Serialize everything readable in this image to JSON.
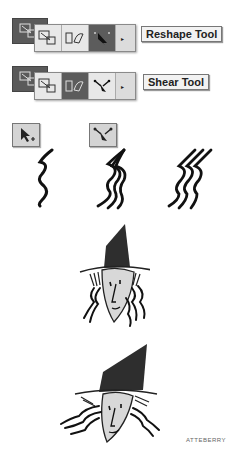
{
  "toolbars": [
    {
      "selected_tool": "reshape",
      "tooltip": "Reshape Tool",
      "buttons": [
        "scale-tool",
        "free-transform-tool",
        "warp-tool",
        "reshape-tool"
      ]
    },
    {
      "selected_tool": "free-transform",
      "tooltip": "Shear Tool",
      "buttons": [
        "scale-tool",
        "free-transform-tool",
        "warp-tool",
        "shear-tool"
      ]
    }
  ],
  "figures": {
    "tool_icons": [
      "direct-select-add-icon",
      "shear-tool-icon"
    ],
    "strokes": [
      "single-wavy-stroke",
      "reshaped-wavy-strokes",
      "sheared-wavy-strokes"
    ],
    "illustrations": [
      "witch-upright",
      "witch-sheared"
    ]
  },
  "credit": "ATTEBERRY",
  "colors": {
    "toolbar_dark": "#5a5a5a",
    "toolbar_light": "#dcdcdc",
    "tooltip_bg": "#f2f2f2",
    "hat": "#2e2e2e",
    "face": "#d8d8d8"
  }
}
